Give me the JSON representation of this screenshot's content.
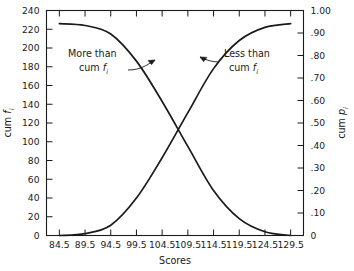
{
  "chart_data": {
    "type": "line",
    "title": "",
    "xlabel": "Scores",
    "ylabel_left": "cum f",
    "ylabel_left_sub": "i",
    "ylabel_right": "cum p",
    "ylabel_right_sub": "i",
    "x_ticks": [
      84.5,
      89.5,
      94.5,
      99.5,
      104.5,
      109.5,
      114.5,
      119.5,
      124.5,
      129.5
    ],
    "x_tick_labels": [
      "84.5",
      "89.5",
      "94.5",
      "99.5",
      "104.5",
      "109.5",
      "114.5",
      "119.5",
      "124.5",
      "129.5"
    ],
    "xlim": [
      82.0,
      132.0
    ],
    "y_left_ticks": [
      0,
      20,
      40,
      60,
      80,
      100,
      120,
      140,
      160,
      180,
      200,
      220,
      240
    ],
    "y_left_tick_labels": [
      "0",
      "20",
      "40",
      "60",
      "80",
      "100",
      "120",
      "140",
      "160",
      "180",
      "200",
      "220",
      "240"
    ],
    "ylim_left": [
      0,
      240
    ],
    "y_right_ticks": [
      0,
      0.1,
      0.2,
      0.3,
      0.4,
      0.5,
      0.6,
      0.7,
      0.8,
      0.9,
      1.0
    ],
    "y_right_tick_labels": [
      "0",
      ".10",
      ".20",
      ".30",
      ".40",
      ".50",
      ".60",
      ".70",
      ".80",
      ".90",
      "1.00"
    ],
    "ylim_right": [
      0,
      1.0
    ],
    "grid": false,
    "legend": "annotations",
    "series": [
      {
        "name": "Less than cum f",
        "annotation": "Less than",
        "annotation_line2": "cum f",
        "x": [
          84.5,
          89.5,
          94.5,
          99.5,
          104.5,
          109.5,
          114.5,
          119.5,
          124.5,
          129.5
        ],
        "values": [
          0,
          2,
          11,
          40,
          83,
          131,
          178,
          208,
          222,
          226
        ]
      },
      {
        "name": "More than cum f",
        "annotation": "More than",
        "annotation_line2": "cum f",
        "x": [
          84.5,
          89.5,
          94.5,
          99.5,
          104.5,
          109.5,
          114.5,
          119.5,
          124.5,
          129.5
        ],
        "values": [
          226,
          224,
          215,
          186,
          143,
          95,
          48,
          18,
          4,
          0
        ]
      }
    ],
    "total_frequency": 226,
    "crossing_point": {
      "x": 107.0,
      "y": 113
    }
  },
  "annotations": {
    "more_than": {
      "line1": "More than",
      "line2_prefix": "cum ",
      "line2_var": "f",
      "line2_sub": "i"
    },
    "less_than": {
      "line1": "Less than",
      "line2_prefix": "cum ",
      "line2_var": "f",
      "line2_sub": "i"
    }
  },
  "axis_titles": {
    "x": "Scores",
    "y_left_prefix": "cum ",
    "y_left_var": "f",
    "y_left_sub": "i",
    "y_right_prefix": "cum ",
    "y_right_var": "p",
    "y_right_sub": "i"
  },
  "style": {
    "line_color": "#1a1a1a",
    "axis_color": "#1a1a1a",
    "background": "#ffffff"
  }
}
